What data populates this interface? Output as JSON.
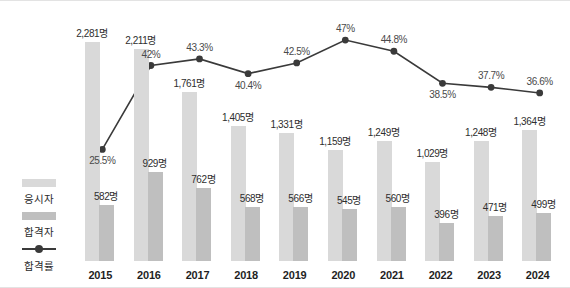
{
  "legend": {
    "items": [
      {
        "label": "응시자",
        "type": "bar-light",
        "name": "legend-applicants"
      },
      {
        "label": "합격자",
        "type": "bar-dark",
        "name": "legend-passers"
      },
      {
        "label": "합격률",
        "type": "line",
        "name": "legend-pass-rate"
      }
    ]
  },
  "colors": {
    "applicants_bar": "#d9d9d9",
    "passers_bar": "#bfbfbf",
    "rate_line": "#3a3a3a",
    "value_label": "#2e2e2e",
    "rate_label": "#4a4a4a",
    "axis_label": "#1f1f1f",
    "frame_border": "#e3e3e3",
    "background": "#ffffff"
  },
  "chart_data": {
    "type": "bar",
    "title": "",
    "subtitle": "",
    "xlabel": "",
    "ylabel": "",
    "grid": false,
    "legend_position": "left-bottom",
    "categories": [
      "2015",
      "2016",
      "2017",
      "2018",
      "2019",
      "2020",
      "2021",
      "2022",
      "2023",
      "2024"
    ],
    "ylim": [
      0,
      2400
    ],
    "rate_ylim": [
      0,
      60
    ],
    "series": [
      {
        "name": "응시자",
        "type": "bar",
        "unit": "명",
        "values": [
          2281,
          2211,
          1761,
          1405,
          1331,
          1159,
          1249,
          1029,
          1248,
          1364
        ],
        "labels": [
          "2,281명",
          "2,211명",
          "1,761명",
          "1,405명",
          "1,331명",
          "1,159명",
          "1,249명",
          "1,029명",
          "1,248명",
          "1,364명"
        ]
      },
      {
        "name": "합격자",
        "type": "bar",
        "unit": "명",
        "values": [
          582,
          929,
          762,
          568,
          566,
          545,
          560,
          396,
          471,
          499
        ],
        "labels": [
          "582명",
          "929명",
          "762명",
          "568명",
          "566명",
          "545명",
          "560명",
          "396명",
          "471명",
          "499명"
        ]
      },
      {
        "name": "합격률",
        "type": "line",
        "unit": "%",
        "values": [
          25.5,
          42,
          43.3,
          40.4,
          42.5,
          47,
          44.8,
          38.5,
          37.7,
          36.6
        ],
        "labels": [
          "25.5%",
          "42%",
          "43.3%",
          "40.4%",
          "42.5%",
          "47%",
          "44.8%",
          "38.5%",
          "37.7%",
          "36.6%"
        ]
      }
    ]
  }
}
